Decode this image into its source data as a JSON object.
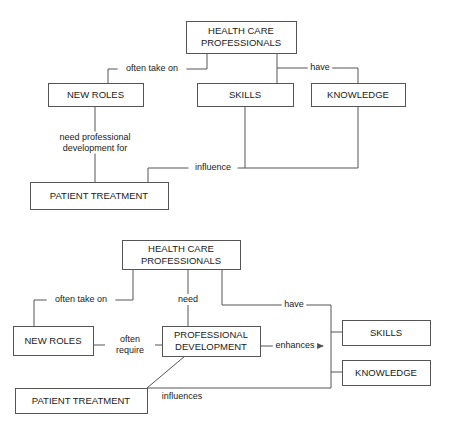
{
  "figure": {
    "type": "concept-map-pair"
  },
  "diagram_top": {
    "id": "concept-map-1",
    "nodes": [
      {
        "id": "hcp",
        "label_line1": "HEALTH CARE",
        "label_line2": "PROFESSIONALS",
        "x": 186,
        "y": 21,
        "w": 110,
        "h": 32
      },
      {
        "id": "new_roles",
        "label_line1": "NEW ROLES",
        "label_line2": "",
        "x": 48,
        "y": 83,
        "w": 95,
        "h": 23
      },
      {
        "id": "skills",
        "label_line1": "SKILLS",
        "label_line2": "",
        "x": 197,
        "y": 83,
        "w": 96,
        "h": 23
      },
      {
        "id": "knowledge",
        "label_line1": "KNOWLEDGE",
        "label_line2": "",
        "x": 311,
        "y": 83,
        "w": 94,
        "h": 23
      },
      {
        "id": "patient_treatment",
        "label_line1": "PATIENT TREATMENT",
        "label_line2": "",
        "x": 30,
        "y": 182,
        "w": 138,
        "h": 27
      }
    ],
    "edges": [
      {
        "id": "often-take-on",
        "label_line1": "often take on",
        "label_line2": "",
        "label_x": 152,
        "label_y": 69,
        "path": "M 207 53 L 207 69 L 108 69 L 108 83"
      },
      {
        "id": "have",
        "label_line1": "have",
        "label_line2": "",
        "label_x": 320,
        "label_y": 68,
        "path": "M 277 53 L 277 83 M 277 68 L 358 68 L 358 83"
      },
      {
        "id": "need-professional-development-for",
        "label_line1": "need professional",
        "label_line2": "development for",
        "label_x": 95,
        "label_y": 143,
        "path": "M 95 106 L 95 182"
      },
      {
        "id": "influence",
        "label_line1": "influence",
        "label_line2": "",
        "label_x": 213,
        "label_y": 168,
        "path": "M 245 106 L 245 168 L 358 168 L 358 106 M 245 168 L 148 168 L 148 182"
      }
    ]
  },
  "diagram_bottom": {
    "id": "concept-map-2",
    "nodes": [
      {
        "id": "hcp",
        "label_line1": "HEALTH CARE",
        "label_line2": "PROFESSIONALS",
        "x": 122,
        "y": 240,
        "w": 118,
        "h": 29
      },
      {
        "id": "new_roles",
        "label_line1": "NEW ROLES",
        "label_line2": "",
        "x": 13,
        "y": 326,
        "w": 80,
        "h": 29
      },
      {
        "id": "professional_development",
        "label_line1": "PROFESSIONAL",
        "label_line2": "DEVELOPMENT",
        "x": 162,
        "y": 326,
        "w": 98,
        "h": 30
      },
      {
        "id": "skills",
        "label_line1": "SKILLS",
        "label_line2": "",
        "x": 342,
        "y": 320,
        "w": 88,
        "h": 25
      },
      {
        "id": "knowledge",
        "label_line1": "KNOWLEDGE",
        "label_line2": "",
        "x": 342,
        "y": 360,
        "w": 88,
        "h": 25
      },
      {
        "id": "patient_treatment",
        "label_line1": "PATIENT TREATMENT",
        "label_line2": "",
        "x": 15,
        "y": 388,
        "w": 132,
        "h": 25
      }
    ],
    "edges": [
      {
        "id": "often-take-on",
        "label_line1": "often take on",
        "label_line2": "",
        "label_x": 81,
        "label_y": 300,
        "path": "M 133 269 L 133 300 L 34 300 L 34 326"
      },
      {
        "id": "need",
        "label_line1": "need",
        "label_line2": "",
        "label_x": 188,
        "label_y": 300,
        "path": "M 188 269 L 188 326"
      },
      {
        "id": "have",
        "label_line1": "have",
        "label_line2": "",
        "label_x": 294,
        "label_y": 305,
        "path": "M 222 269 L 222 305 L 331 305 L 331 332"
      },
      {
        "id": "often-require",
        "label_line1": "often",
        "label_line2": "require",
        "label_x": 130,
        "label_y": 345,
        "path": "M 93 345 L 105 345 M 155 345 L 162 345"
      },
      {
        "id": "enhances",
        "label_line1": "enhances",
        "label_line2": "",
        "label_x": 295,
        "label_y": 346,
        "path": "M 260 346 L 323 346"
      },
      {
        "id": "influences",
        "label_line1": "influences",
        "label_line2": "",
        "label_x": 182,
        "label_y": 397,
        "path": "M 185 356 L 147 388"
      },
      {
        "id": "skills-knowledge-trunk",
        "label_line1": "",
        "label_line2": "",
        "label_x": 0,
        "label_y": 0,
        "path": "M 331 332 L 331 372 L 342 372 M 331 332 L 342 332"
      },
      {
        "id": "pd-to-knowledge-return",
        "label_line1": "",
        "label_line2": "",
        "label_x": 0,
        "label_y": 0,
        "path": "M 147 388 L 331 388 L 331 372"
      }
    ]
  }
}
